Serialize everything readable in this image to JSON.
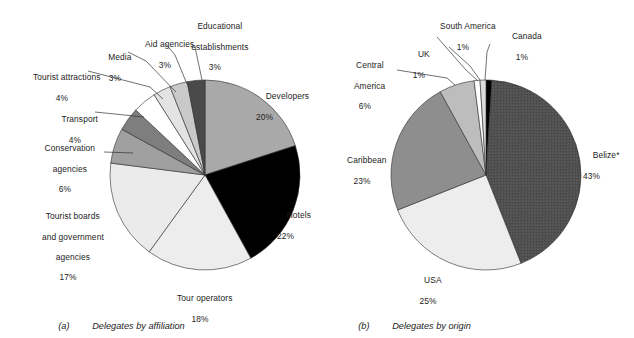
{
  "figure": {
    "background": "#ffffff",
    "width": 634,
    "height": 338
  },
  "panels": [
    {
      "tag": "(a)",
      "caption": "Delegates by affiliation",
      "caption_tag_name": "panel-a-tag",
      "center": {
        "x": 205,
        "y": 175
      },
      "radius": 95
    },
    {
      "tag": "(b)",
      "caption": "Delegates by origin",
      "caption_tag_name": "panel-b-tag",
      "center": {
        "x": 486,
        "y": 175
      },
      "radius": 95
    }
  ],
  "labels_a": [
    {
      "name": "Educational establishments",
      "pct": "3%",
      "line1": "Educational",
      "line2": "establishments"
    },
    {
      "name": "Aid agencies",
      "pct": "3%",
      "line1": "Aid agencies",
      "line2": ""
    },
    {
      "name": "Media",
      "pct": "3%",
      "line1": "Media",
      "line2": ""
    },
    {
      "name": "Tourist attractions",
      "pct": "4%",
      "line1": "Tourist attractions",
      "line2": ""
    },
    {
      "name": "Transport",
      "pct": "4%",
      "line1": "Transport",
      "line2": ""
    },
    {
      "name": "Conservation agencies",
      "pct": "6%",
      "line1": "Conservation",
      "line2": "agencies"
    },
    {
      "name": "Tourist boards and government agencies",
      "pct": "17%",
      "line1": "Tourist boards",
      "line2": "and government",
      "line3": "agencies"
    },
    {
      "name": "Tour operators",
      "pct": "18%",
      "line1": "Tour operators",
      "line2": ""
    },
    {
      "name": "Hotels",
      "pct": "22%",
      "line1": "Hotels",
      "line2": ""
    },
    {
      "name": "Developers",
      "pct": "20%",
      "line1": "Developers",
      "line2": ""
    }
  ],
  "labels_b": [
    {
      "name": "South America",
      "pct": "1%",
      "line1": "South America",
      "line2": ""
    },
    {
      "name": "Canada",
      "pct": "1%",
      "line1": "Canada",
      "line2": ""
    },
    {
      "name": "UK",
      "pct": "1%",
      "line1": "UK",
      "line2": ""
    },
    {
      "name": "Central America",
      "pct": "6%",
      "line1": "Central",
      "line2": "America"
    },
    {
      "name": "Caribbean",
      "pct": "23%",
      "line1": "Caribbean",
      "line2": ""
    },
    {
      "name": "USA",
      "pct": "25%",
      "line1": "USA",
      "line2": ""
    },
    {
      "name": "Belize*",
      "pct": "43%",
      "line1": "Belize*",
      "line2": ""
    }
  ],
  "chart_data": [
    {
      "type": "pie",
      "title": "(a)  Delegates by affiliation",
      "subtitle": "",
      "xlabel": "",
      "ylabel": "",
      "start_angle_deg": 0,
      "direction": "clockwise",
      "units": "percent",
      "legend_position": "none (direct labels with leader lines)",
      "grid": false,
      "categories": [
        "Developers",
        "Hotels",
        "Tour operators",
        "Tourist boards and government agencies",
        "Conservation agencies",
        "Transport",
        "Tourist attractions",
        "Media",
        "Aid agencies",
        "Educational establishments"
      ],
      "values": [
        20,
        22,
        18,
        17,
        6,
        4,
        4,
        3,
        3,
        3
      ],
      "slice_colors": [
        "#a9a9a9",
        "#000000",
        "#ededed",
        "#ebebeb",
        "#a0a0a0",
        "#7e7e7e",
        "#ffffff",
        "#e3e3e3",
        "#c9c9c9",
        "#4a4a4a"
      ]
    },
    {
      "type": "pie",
      "title": "(b)  Delegates by origin",
      "subtitle": "",
      "xlabel": "",
      "ylabel": "",
      "start_angle_deg": 0,
      "direction": "clockwise",
      "units": "percent",
      "legend_position": "none (direct labels with leader lines)",
      "grid": false,
      "categories": [
        "Canada",
        "Belize*",
        "USA",
        "Caribbean",
        "Central America",
        "UK",
        "South America"
      ],
      "values": [
        1,
        43,
        25,
        23,
        6,
        1,
        1
      ],
      "slice_colors": [
        "#000000",
        "#4f4f4f",
        "#ededed",
        "#8e8e8e",
        "#bdbdbd",
        "#ffffff",
        "#dcdcdc"
      ]
    }
  ]
}
